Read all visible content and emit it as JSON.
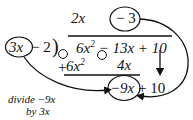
{
  "figure": {
    "type": "polynomial-long-division-diagram",
    "background_color": "#ffffff",
    "ink_color": "#111111"
  },
  "quotient": {
    "term1": "2x",
    "term2_circled": "− 3"
  },
  "divisor": {
    "circled_term": "3x",
    "rest": "− 2",
    "bracket": ")"
  },
  "dividend": {
    "text": "6x² − 13x + 10",
    "coef_x2": 6,
    "coef_x": -13,
    "constant": 10
  },
  "subtract_row": {
    "leading_sign": "+",
    "body": "6x²",
    "middle_sign": "−",
    "tail": "4x",
    "circled_minus": "⊖",
    "circled_plus": "⊕"
  },
  "remainder_row": {
    "circled_term": "−9x",
    "rest": "+ 10",
    "coef_x": -9,
    "constant": 10
  },
  "annotation": {
    "line1": "divide −9x",
    "line2": "by 3x"
  },
  "arrows": {
    "bring_down_arrow": "down-arrow",
    "quotient_to_remainder_curve": "curved-arrow",
    "divisor_to_remainder_curve": "curved-arrow"
  }
}
